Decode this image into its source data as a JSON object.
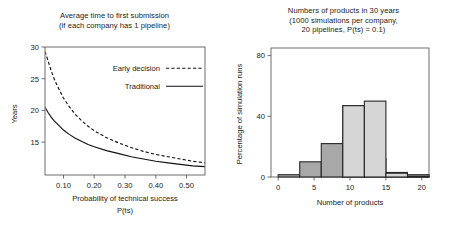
{
  "figure": {
    "background": "#ffffff",
    "ink": "#1a1a1a"
  },
  "left": {
    "title_line1": "Average time to first submission",
    "title_line2": "(if each company has 1 pipeline)",
    "legend": {
      "early_label": "Early decision",
      "traditional_label": "Traditional"
    },
    "axis": {
      "ylabel": "Years",
      "xlabel_line1": "Probability of technical success",
      "xlabel_line2": "P(ts)",
      "yticks": [
        "30",
        "25",
        "20",
        "15"
      ],
      "xticks": [
        "0.10",
        "0.20",
        "0.30",
        "0.40",
        "0.50"
      ]
    },
    "chart_data": {
      "type": "line",
      "title": "Average time to first submission (if each company has 1 pipeline)",
      "xlabel": "Probability of technical success P(ts)",
      "ylabel": "Years",
      "xlim": [
        0.04,
        0.56
      ],
      "ylim": [
        13.2,
        30.0
      ],
      "xticks": [
        0.1,
        0.2,
        0.3,
        0.4,
        0.5
      ],
      "yticks": [
        15,
        20,
        25,
        30
      ],
      "grid": false,
      "legend_position": "upper right",
      "series": [
        {
          "name": "Early decision",
          "style": "dashed",
          "color": "#111111",
          "x": [
            0.04,
            0.05,
            0.06,
            0.07,
            0.08,
            0.1,
            0.12,
            0.14,
            0.16,
            0.18,
            0.2,
            0.24,
            0.28,
            0.32,
            0.36,
            0.4,
            0.44,
            0.48,
            0.52,
            0.56
          ],
          "y": [
            29.4,
            28.2,
            26.9,
            25.8,
            24.9,
            23.3,
            22.1,
            21.1,
            20.3,
            19.6,
            19.0,
            18.1,
            17.4,
            16.8,
            16.3,
            15.9,
            15.6,
            15.3,
            15.0,
            14.8
          ]
        },
        {
          "name": "Traditional",
          "style": "solid",
          "color": "#111111",
          "x": [
            0.04,
            0.05,
            0.06,
            0.07,
            0.08,
            0.1,
            0.12,
            0.14,
            0.16,
            0.18,
            0.2,
            0.24,
            0.28,
            0.32,
            0.36,
            0.4,
            0.44,
            0.48,
            0.52,
            0.56
          ],
          "y": [
            22.1,
            21.4,
            20.8,
            20.3,
            19.9,
            19.1,
            18.5,
            18.0,
            17.6,
            17.2,
            16.9,
            16.4,
            16.0,
            15.6,
            15.3,
            15.0,
            14.8,
            14.6,
            14.4,
            14.3
          ]
        }
      ]
    }
  },
  "right": {
    "title_line1": "Numbers of products in 30 years",
    "title_line2": "(1000 simulations per company,",
    "title_line3": "20 pipelines, P(ts) = 0.1)",
    "axis": {
      "ylabel": "Percentage of simulation runs",
      "xlabel": "Number of products",
      "yticks": [
        "0",
        "40",
        "80"
      ],
      "xticks": [
        "0",
        "5",
        "10",
        "15",
        "20"
      ]
    },
    "chart_data": {
      "type": "bar",
      "title": "Numbers of products in 30 years (1000 simulations per company, 20 pipelines, P(ts) = 0.1)",
      "xlabel": "Number of products",
      "ylabel": "Percentage of simulation runs",
      "xlim": [
        -1,
        21
      ],
      "ylim": [
        0,
        85
      ],
      "xticks": [
        0,
        5,
        10,
        15,
        20
      ],
      "yticks": [
        0,
        40,
        80
      ],
      "grid": false,
      "legend_position": "none",
      "bin_width": 3,
      "bin_edges": [
        0,
        3,
        6,
        9,
        12,
        15,
        18,
        21
      ],
      "series": [
        {
          "name": "dark-series",
          "color": "#a8a8a8",
          "edge_color": "#262626",
          "bin_centers": [
            1.5,
            4.5,
            7.5,
            10.5,
            13.5,
            16.5,
            19.5
          ],
          "values": [
            1.5,
            10,
            22,
            47,
            12,
            3,
            1.5
          ]
        },
        {
          "name": "light-series",
          "color": "#d6d6d6",
          "edge_color": "#262626",
          "bin_centers": [
            1.5,
            4.5,
            7.5,
            10.5,
            13.5,
            16.5,
            19.5
          ],
          "values": [
            0,
            0,
            0,
            47,
            50,
            2.5,
            0.5
          ]
        }
      ]
    }
  }
}
